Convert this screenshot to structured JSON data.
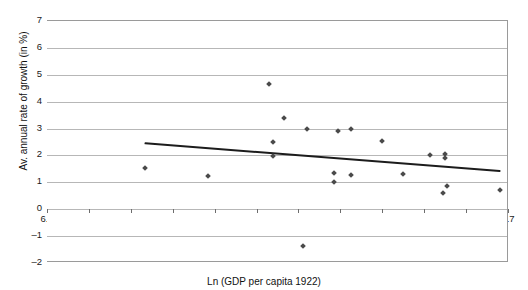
{
  "chart_data": {
    "type": "scatter",
    "title": "",
    "xlabel": "Ln (GDP per capita 1922)",
    "ylabel": "Av. annual rate of growth (in %)",
    "xlim": [
      6.5,
      8.7
    ],
    "ylim": [
      -2,
      7
    ],
    "xticks": [
      "6.5",
      "6.7",
      "6.9",
      "7.1",
      "7.3",
      "7.5",
      "7.7",
      "7.9",
      "8.1",
      "8.3",
      "8.5",
      "8.7"
    ],
    "yticks": [
      "-2",
      "-1",
      "0",
      "1",
      "2",
      "3",
      "4",
      "5",
      "6",
      "7"
    ],
    "grid": "horizontal",
    "legend": "none",
    "marker": "diamond",
    "marker_color": "#4a4a4a",
    "series": [
      {
        "name": "Countries",
        "points": [
          {
            "x": 6.97,
            "y": 1.55
          },
          {
            "x": 7.27,
            "y": 1.25
          },
          {
            "x": 7.56,
            "y": 4.65
          },
          {
            "x": 7.58,
            "y": 2.5
          },
          {
            "x": 7.58,
            "y": 1.98
          },
          {
            "x": 7.63,
            "y": 3.4
          },
          {
            "x": 7.72,
            "y": -1.35
          },
          {
            "x": 7.74,
            "y": 3.0
          },
          {
            "x": 7.87,
            "y": 1.35
          },
          {
            "x": 7.87,
            "y": 1.0
          },
          {
            "x": 7.89,
            "y": 2.9
          },
          {
            "x": 7.95,
            "y": 3.0
          },
          {
            "x": 7.95,
            "y": 1.28
          },
          {
            "x": 8.1,
            "y": 2.55
          },
          {
            "x": 8.2,
            "y": 1.3
          },
          {
            "x": 8.33,
            "y": 2.0
          },
          {
            "x": 8.39,
            "y": 0.6
          },
          {
            "x": 8.4,
            "y": 2.05
          },
          {
            "x": 8.4,
            "y": 1.92
          },
          {
            "x": 8.41,
            "y": 0.85
          },
          {
            "x": 8.66,
            "y": 0.7
          }
        ]
      }
    ],
    "trendline": {
      "name": "Linear trend",
      "color": "#1c1c1c",
      "x0": 6.97,
      "y0": 2.45,
      "x1": 8.66,
      "y1": 1.42
    }
  }
}
